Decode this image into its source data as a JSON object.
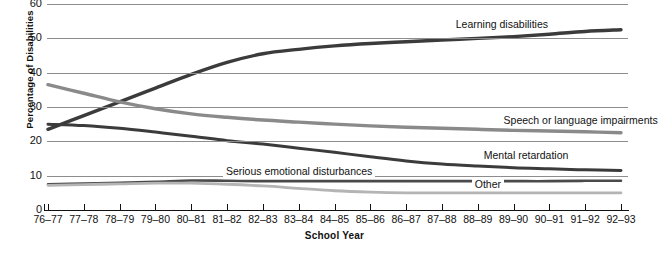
{
  "chart_data": {
    "type": "line",
    "title": "",
    "xlabel": "School Year",
    "ylabel": "Percentage of Disabilities",
    "ylim": [
      0,
      60
    ],
    "ytick_labels": [
      "60",
      "50",
      "40",
      "30",
      "20",
      "10",
      "0"
    ],
    "yticks": [
      60,
      50,
      40,
      30,
      20,
      10,
      0
    ],
    "grid": "horizontal",
    "legend": "inline-labels",
    "categories": [
      "76–77",
      "77–78",
      "78–79",
      "79–80",
      "80–81",
      "81–82",
      "82–83",
      "83–84",
      "84–85",
      "85–86",
      "86–87",
      "87–88",
      "88–89",
      "89–90",
      "90–91",
      "91–92",
      "92–93"
    ],
    "series": [
      {
        "name": "Learning disabilities",
        "color": "#3b3b3b",
        "values": [
          23.5,
          27.5,
          31.5,
          35.5,
          39.5,
          43.0,
          45.5,
          46.8,
          47.8,
          48.5,
          49.0,
          49.5,
          50.0,
          50.5,
          51.2,
          52.0,
          52.5
        ]
      },
      {
        "name": "Speech or language impairments",
        "color": "#8a8a8a",
        "values": [
          36.5,
          34.0,
          31.5,
          29.5,
          28.0,
          27.0,
          26.2,
          25.6,
          25.0,
          24.5,
          24.1,
          23.8,
          23.5,
          23.2,
          23.0,
          22.8,
          22.5
        ]
      },
      {
        "name": "Mental retardation",
        "color": "#3b3b3b",
        "values": [
          25.0,
          24.6,
          23.8,
          22.7,
          21.5,
          20.2,
          19.2,
          18.0,
          16.8,
          15.5,
          14.3,
          13.4,
          12.8,
          12.3,
          12.0,
          11.7,
          11.5
        ]
      },
      {
        "name": "Serious emotional disturbances",
        "color": "#4a4a4a",
        "values": [
          7.5,
          7.7,
          7.9,
          8.2,
          8.6,
          8.5,
          8.4,
          8.4,
          8.4,
          8.4,
          8.4,
          8.4,
          8.4,
          8.4,
          8.4,
          8.5,
          8.5
        ]
      },
      {
        "name": "Other",
        "color": "#b4b4b4",
        "values": [
          7.2,
          7.4,
          7.6,
          7.8,
          7.8,
          7.5,
          7.0,
          6.3,
          5.6,
          5.2,
          5.0,
          5.0,
          5.0,
          5.0,
          5.0,
          5.0,
          5.0
        ]
      }
    ],
    "annotations": [
      {
        "text": "Learning disabilities",
        "series": "Learning disabilities"
      },
      {
        "text": "Speech or language impairments",
        "series": "Speech or language impairments"
      },
      {
        "text": "Mental retardation",
        "series": "Mental retardation"
      },
      {
        "text": "Serious emotional disturbances",
        "series": "Serious emotional disturbances"
      },
      {
        "text": "Other",
        "series": "Other"
      }
    ]
  },
  "labels": {
    "learning_disabilities": "Learning disabilities",
    "speech_or_language": "Speech or language impairments",
    "mental_retardation": "Mental retardation",
    "serious_emotional": "Serious emotional disturbances",
    "other": "Other",
    "y_axis_title": "Percentage of Disabilities",
    "x_axis_title": "School Year"
  },
  "y_ticks": [
    "60",
    "50",
    "40",
    "30",
    "20",
    "10",
    "0"
  ],
  "x_ticks": [
    "76–77",
    "77–78",
    "78–79",
    "79–80",
    "80–81",
    "81–82",
    "82–83",
    "83–84",
    "84–85",
    "85–86",
    "86–87",
    "87–88",
    "88–89",
    "89–90",
    "90–91",
    "91–92",
    "92–93"
  ],
  "colors": {
    "learning_disabilities": "#3b3b3b",
    "speech_or_language": "#8a8a8a",
    "mental_retardation": "#3b3b3b",
    "serious_emotional": "#4a4a4a",
    "other": "#b4b4b4",
    "gridline": "#8d8d8d",
    "axis": "#111111"
  }
}
